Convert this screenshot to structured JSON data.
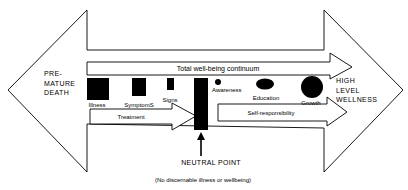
{
  "diagram": {
    "type": "illness-wellness continuum",
    "colors": {
      "stroke": "#000000",
      "fill": "#ffffff",
      "block": "#000000"
    },
    "left_end": {
      "lines": [
        "PRE-",
        "MATURE",
        "DEATH"
      ]
    },
    "right_end": {
      "lines": [
        "HIGH",
        "LEVEL",
        "WELLNESS"
      ]
    },
    "top_arrow": {
      "label": "Total well-being continuum"
    },
    "left_stages": [
      {
        "label": "Illness",
        "shape": "square-large"
      },
      {
        "label": "SymptomS",
        "shape": "square-medium"
      },
      {
        "label": "Signs",
        "shape": "square-small"
      }
    ],
    "right_stages": [
      {
        "label": "Awareness",
        "shape": "dot-small"
      },
      {
        "label": "Education",
        "shape": "ellipse-medium"
      },
      {
        "label": "Growth",
        "shape": "circle-large"
      }
    ],
    "treatment_arrow": {
      "label": "Treatment"
    },
    "self_responsibility_arrow": {
      "label": "Self-responsibility"
    },
    "neutral": {
      "label": "NEUTRAL POINT",
      "caption": "(No discernable illness or wellbeing)"
    }
  }
}
